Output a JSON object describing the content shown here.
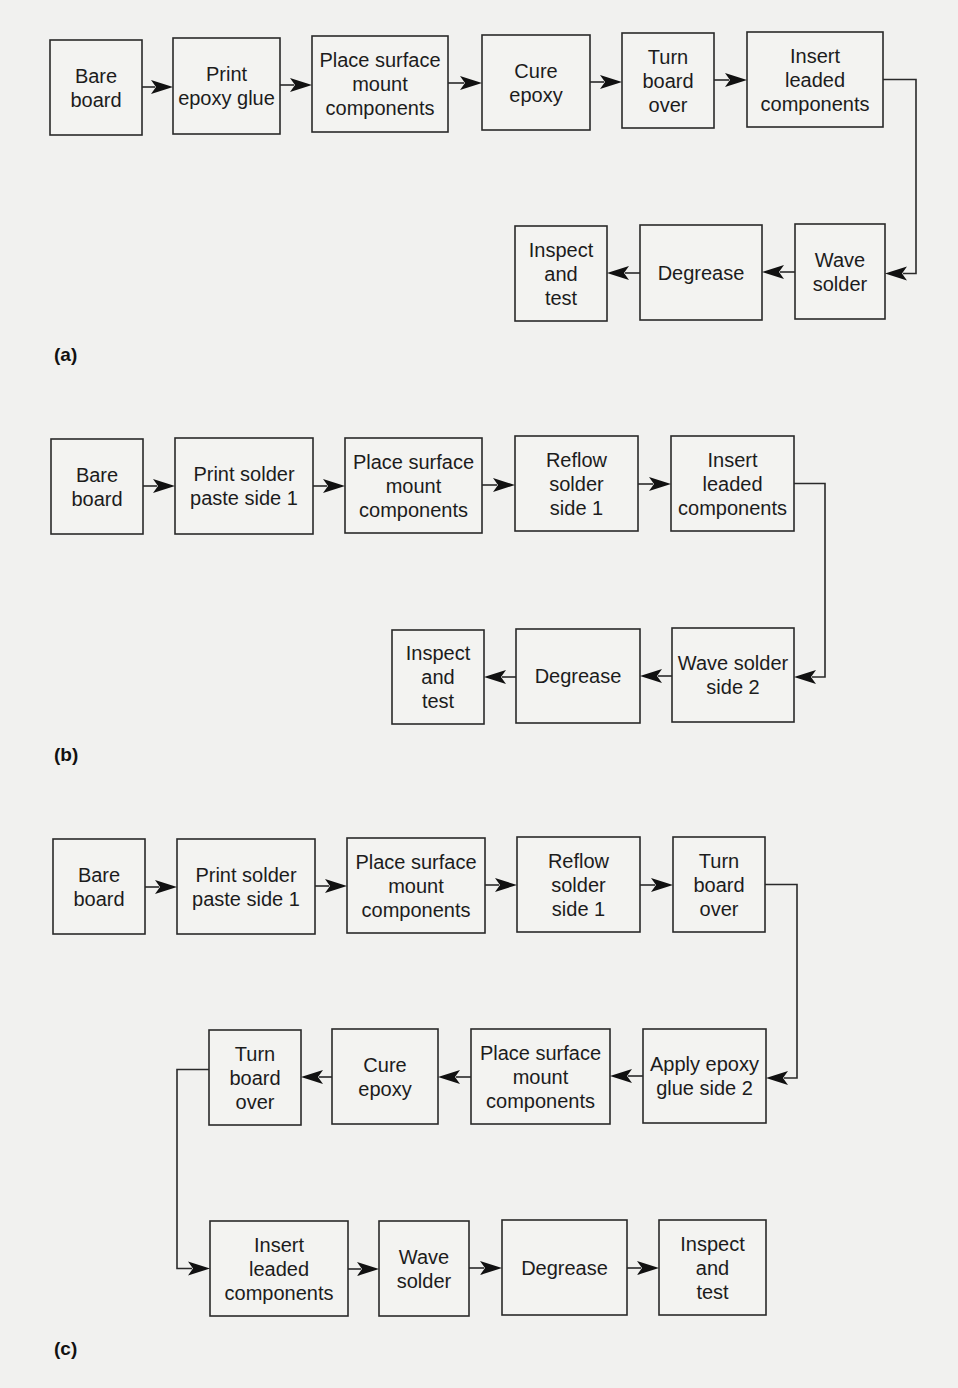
{
  "figure": {
    "panels": [
      {
        "id": "a",
        "label": "(a)",
        "steps": [
          {
            "id": "bare-board",
            "lines": [
              "Bare",
              "board"
            ]
          },
          {
            "id": "print-epoxy-glue",
            "lines": [
              "Print",
              "epoxy glue"
            ]
          },
          {
            "id": "place-smt",
            "lines": [
              "Place surface",
              "mount",
              "components"
            ]
          },
          {
            "id": "cure-epoxy",
            "lines": [
              "Cure",
              "epoxy"
            ]
          },
          {
            "id": "turn-board-over",
            "lines": [
              "Turn",
              "board",
              "over"
            ]
          },
          {
            "id": "insert-leaded",
            "lines": [
              "Insert",
              "leaded",
              "components"
            ]
          },
          {
            "id": "wave-solder",
            "lines": [
              "Wave",
              "solder"
            ]
          },
          {
            "id": "degrease",
            "lines": [
              "Degrease"
            ]
          },
          {
            "id": "inspect-test",
            "lines": [
              "Inspect",
              "and",
              "test"
            ]
          }
        ]
      },
      {
        "id": "b",
        "label": "(b)",
        "steps": [
          {
            "id": "bare-board",
            "lines": [
              "Bare",
              "board"
            ]
          },
          {
            "id": "print-solder-paste",
            "lines": [
              "Print solder",
              "paste side 1"
            ]
          },
          {
            "id": "place-smt",
            "lines": [
              "Place surface",
              "mount",
              "components"
            ]
          },
          {
            "id": "reflow-solder",
            "lines": [
              "Reflow",
              "solder",
              "side 1"
            ]
          },
          {
            "id": "insert-leaded",
            "lines": [
              "Insert",
              "leaded",
              "components"
            ]
          },
          {
            "id": "wave-solder-side2",
            "lines": [
              "Wave solder",
              "side 2"
            ]
          },
          {
            "id": "degrease",
            "lines": [
              "Degrease"
            ]
          },
          {
            "id": "inspect-test",
            "lines": [
              "Inspect",
              "and",
              "test"
            ]
          }
        ]
      },
      {
        "id": "c",
        "label": "(c)",
        "steps": [
          {
            "id": "bare-board",
            "lines": [
              "Bare",
              "board"
            ]
          },
          {
            "id": "print-solder-paste",
            "lines": [
              "Print solder",
              "paste side 1"
            ]
          },
          {
            "id": "place-smt",
            "lines": [
              "Place surface",
              "mount",
              "components"
            ]
          },
          {
            "id": "reflow-solder",
            "lines": [
              "Reflow",
              "solder",
              "side 1"
            ]
          },
          {
            "id": "turn-board-over",
            "lines": [
              "Turn",
              "board",
              "over"
            ]
          },
          {
            "id": "apply-epoxy-glue",
            "lines": [
              "Apply epoxy",
              "glue side 2"
            ]
          },
          {
            "id": "place-smt-2",
            "lines": [
              "Place surface",
              "mount",
              "components"
            ]
          },
          {
            "id": "cure-epoxy",
            "lines": [
              "Cure",
              "epoxy"
            ]
          },
          {
            "id": "turn-board-over-2",
            "lines": [
              "Turn",
              "board",
              "over"
            ]
          },
          {
            "id": "insert-leaded",
            "lines": [
              "Insert",
              "leaded",
              "components"
            ]
          },
          {
            "id": "wave-solder",
            "lines": [
              "Wave",
              "solder"
            ]
          },
          {
            "id": "degrease",
            "lines": [
              "Degrease"
            ]
          },
          {
            "id": "inspect-test",
            "lines": [
              "Inspect",
              "and",
              "test"
            ]
          }
        ]
      }
    ]
  }
}
